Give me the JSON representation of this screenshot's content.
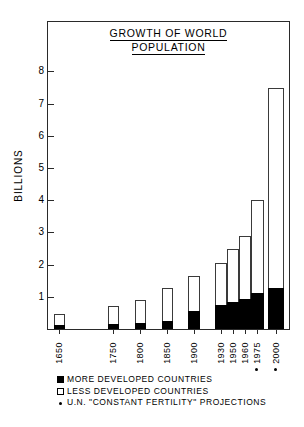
{
  "chart_data": {
    "type": "bar",
    "title": "GROWTH OF WORLD POPULATION",
    "title_line_1": "GROWTH OF WORLD",
    "title_line_2": "POPULATION",
    "xlabel": "",
    "ylabel": "BILLIONS",
    "ylim": [
      0,
      8.6
    ],
    "grid": false,
    "stacked": true,
    "categories": [
      "1650",
      "1750",
      "1800",
      "1850",
      "1900",
      "1930",
      "1950",
      "1960",
      "•1975",
      "•2000"
    ],
    "category_labels": [
      "1650",
      "1750",
      "1800",
      "1850",
      "1900",
      "1930",
      "1950",
      "1960",
      "1975",
      "2000"
    ],
    "projection_flags": [
      false,
      false,
      false,
      false,
      false,
      false,
      false,
      false,
      true,
      true
    ],
    "ytick_labels": [
      "1",
      "2",
      "3",
      "4",
      "5",
      "6",
      "7",
      "8"
    ],
    "ytick_values": [
      1,
      2,
      3,
      4,
      5,
      6,
      7,
      8
    ],
    "series": [
      {
        "name": "MORE DEVELOPED COUNTRIES",
        "color": "#000000",
        "values": [
          0.11,
          0.15,
          0.2,
          0.26,
          0.55,
          0.76,
          0.83,
          0.94,
          1.13,
          1.26
        ]
      },
      {
        "name": "LESS DEVELOPED COUNTRIES",
        "color": "#ffffff",
        "values": [
          0.36,
          0.57,
          0.71,
          1.0,
          1.1,
          1.29,
          1.67,
          1.96,
          2.87,
          6.24
        ]
      }
    ],
    "totals": [
      0.47,
      0.72,
      0.91,
      1.26,
      1.65,
      2.05,
      2.5,
      2.9,
      4.0,
      7.5
    ],
    "legend_position": "below-axes"
  },
  "legend": {
    "items": [
      {
        "symbol": "filled-square",
        "label": "MORE DEVELOPED COUNTRIES"
      },
      {
        "symbol": "open-square",
        "label": "LESS DEVELOPED COUNTRIES"
      },
      {
        "symbol": "dot",
        "label": "U.N. \"CONSTANT FERTILITY\" PROJECTIONS"
      }
    ]
  },
  "colors": {
    "more_developed": "#000000",
    "less_developed": "#ffffff",
    "axis": "#2a2a2a",
    "background": "#ffffff"
  }
}
